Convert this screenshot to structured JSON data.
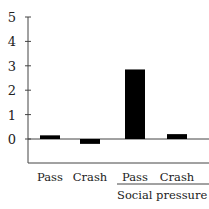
{
  "chart_data": {
    "type": "bar",
    "title": "",
    "xlabel": "",
    "ylabel": "",
    "categories": [
      "Pass",
      "Crash",
      "Pass",
      "Crash"
    ],
    "group_labels": [
      {
        "label": "Social pressure",
        "categories": [
          2,
          3
        ]
      }
    ],
    "values": [
      0.15,
      -0.2,
      2.85,
      0.2
    ],
    "ylim": [
      -1,
      5
    ],
    "yticks": [
      0,
      1,
      2,
      3,
      4,
      5
    ],
    "grid": false,
    "bar_color": "#000000"
  }
}
